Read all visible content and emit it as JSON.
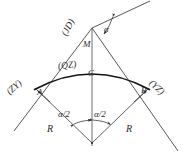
{
  "diagram": {
    "type": "geometric-line-diagram",
    "canvas": {
      "width": 185,
      "height": 157
    },
    "stroke_color": "#2b2b2b",
    "arc_color": "#111111",
    "background": "#ffffff",
    "labels": {
      "jd": "(JD)",
      "zy": "(ZY)",
      "yz": "(YZ)",
      "qz": "(QZ)",
      "point_m": "M",
      "point_c": "C",
      "point_a": "A",
      "point_b": "B",
      "alpha": "α",
      "alpha_half_left": "α/2",
      "alpha_half_right": "α/2",
      "radius_left": "R",
      "radius_right": "R"
    },
    "points": {
      "jd": {
        "x": 92,
        "y": 28,
        "name": "intersection-point"
      },
      "m": {
        "x": 92,
        "y": 46,
        "name": "external-distance-point"
      },
      "c": {
        "x": 92,
        "y": 73,
        "name": "curve-midpoint"
      },
      "a": {
        "x": 35,
        "y": 88,
        "name": "curve-start-point"
      },
      "b": {
        "x": 149,
        "y": 88,
        "name": "curve-end-point"
      },
      "center": {
        "x": 92,
        "y": 143,
        "name": "circle-center"
      }
    },
    "lines": [
      {
        "name": "left-tangent",
        "x1": 14,
        "y1": 131,
        "x2": 92,
        "y2": 28
      },
      {
        "name": "right-tangent",
        "x1": 92,
        "y1": 28,
        "x2": 178,
        "y2": 151
      },
      {
        "name": "back-tangent-ext",
        "x1": 92,
        "y1": 28,
        "x2": 148,
        "y2": 2
      },
      {
        "name": "center-axis",
        "x1": 92,
        "y1": 28,
        "x2": 92,
        "y2": 146
      },
      {
        "name": "radius-left",
        "x1": 35,
        "y1": 88,
        "x2": 92,
        "y2": 143
      },
      {
        "name": "radius-right",
        "x1": 149,
        "y1": 88,
        "x2": 92,
        "y2": 143
      }
    ],
    "arc": {
      "name": "circular-curve-arc",
      "from": {
        "x": 35,
        "y": 88
      },
      "to": {
        "x": 149,
        "y": 88
      },
      "apex": {
        "x": 92,
        "y": 73
      }
    },
    "angle_arcs": [
      {
        "name": "alpha-deflection-angle",
        "at": "jd"
      },
      {
        "name": "alpha-half-left",
        "at": "center"
      },
      {
        "name": "alpha-half-right",
        "at": "center"
      }
    ]
  }
}
